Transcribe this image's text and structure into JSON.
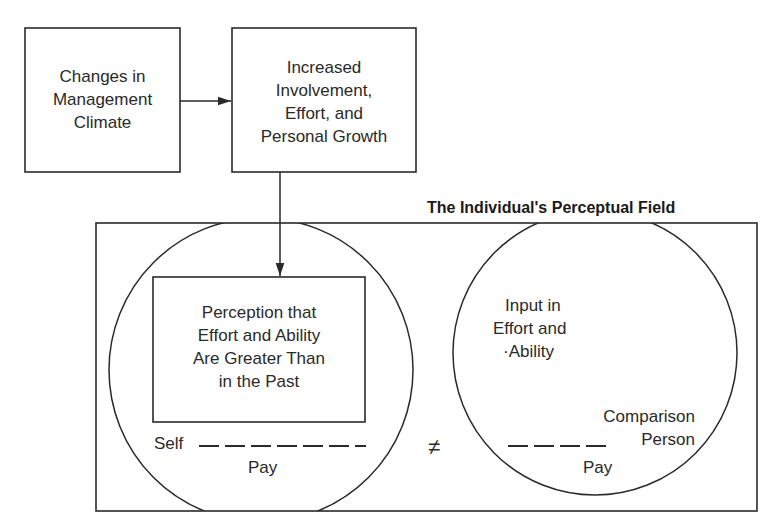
{
  "diagram": {
    "boxes": {
      "management_climate": "Changes in Management Climate",
      "involvement": [
        "Increased",
        "Involvement,",
        "Effort, and",
        "Personal Growth"
      ],
      "perception": [
        "Perception that",
        "Effort and Ability",
        "Are Greater Than",
        "in the Past"
      ]
    },
    "management_lines": [
      "Changes in",
      "Management",
      "Climate"
    ],
    "field_title": "The Individual's Perceptual Field",
    "self_circle": {
      "self_label": "Self",
      "pay_label": "Pay"
    },
    "comparison_circle": {
      "input_lines": [
        "Input in",
        "Effort and",
        "·Ability"
      ],
      "comparison_lines": [
        "Comparison",
        "Person"
      ],
      "pay_label": "Pay"
    },
    "not_equal_symbol": "≠",
    "colors": {
      "line": "#2a2a2a",
      "background": "#ffffff"
    }
  }
}
